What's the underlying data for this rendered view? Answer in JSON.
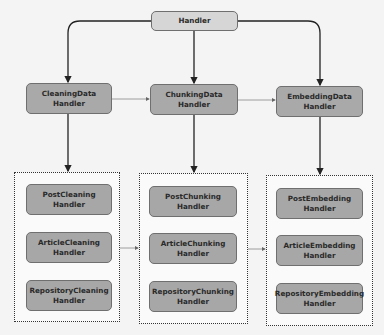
{
  "diagram": {
    "root": {
      "label": "Handler"
    },
    "level1": [
      {
        "label": "CleaningData\nHandler"
      },
      {
        "label": "ChunkingData\nHandler"
      },
      {
        "label": "EmbeddingData\nHandler"
      }
    ],
    "groups": [
      {
        "items": [
          "PostCleaning\nHandler",
          "ArticleCleaning\nHandler",
          "RepositoryCleaning\nHandler"
        ]
      },
      {
        "items": [
          "PostChunking\nHandler",
          "ArticleChunking\nHandler",
          "RepositoryChunking\nHandler"
        ]
      },
      {
        "items": [
          "PostEmbedding\nHandler",
          "ArticleEmbedding\nHandler",
          "RepositoryEmbedding\nHandler"
        ]
      }
    ],
    "colors": {
      "root_fill": "#d6d6d6",
      "node_fill": "#a9a9a9",
      "edge": "#222222",
      "flow_edge": "#8a8a8a"
    }
  }
}
